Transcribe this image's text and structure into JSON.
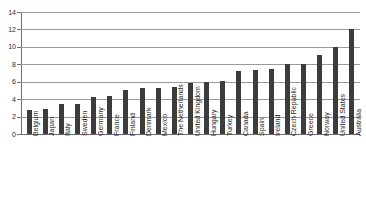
{
  "title_strip": {
    "text": "· · ·  · ·  ·· ·  ·  ·   ·  ·· ·  ·  ·   ·  ·",
    "note_visible": false
  },
  "chart_data": {
    "type": "bar",
    "title": "",
    "xlabel": "",
    "ylabel": "",
    "ylim": [
      0,
      14
    ],
    "yticks": [
      0,
      2,
      4,
      6,
      8,
      10,
      12,
      14
    ],
    "ytick_labels": [
      "0",
      "2",
      "4",
      "6",
      "8",
      "10",
      "12",
      "14"
    ],
    "grid": true,
    "grid_axis": "y",
    "legend": false,
    "bar_color": "#3c3c3c",
    "categories": [
      "Belgium",
      "Japan",
      "Italy",
      "Sweden",
      "Germany",
      "France",
      "Finland",
      "Denmark",
      "Mexico",
      "The Netherlands",
      "United Kingdom",
      "Hungary",
      "Turkey",
      "Canada",
      "Spain",
      "Ireland",
      "Czech Republic",
      "Greece",
      "Norway",
      "United States",
      "Australia"
    ],
    "values": [
      2.7,
      2.9,
      3.5,
      3.5,
      4.2,
      4.4,
      5.0,
      5.3,
      5.3,
      5.4,
      5.8,
      6.0,
      6.1,
      7.2,
      7.4,
      7.5,
      8.0,
      8.0,
      9.1,
      10.0,
      12.0
    ]
  }
}
